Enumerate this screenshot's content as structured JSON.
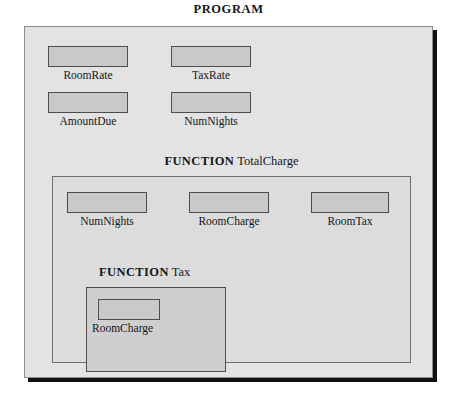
{
  "diagram": {
    "title": "PROGRAM",
    "program_scope": {
      "name": "PROGRAM",
      "variables": [
        {
          "label": "RoomRate"
        },
        {
          "label": "TaxRate"
        },
        {
          "label": "AmountDue"
        },
        {
          "label": "NumNights"
        }
      ]
    },
    "totalcharge_scope": {
      "keyword": "FUNCTION",
      "name": "TotalCharge",
      "variables": [
        {
          "label": "NumNights"
        },
        {
          "label": "RoomCharge"
        },
        {
          "label": "RoomTax"
        }
      ]
    },
    "tax_scope": {
      "keyword": "FUNCTION",
      "name": "Tax",
      "variables": [
        {
          "label": "RoomCharge"
        }
      ]
    }
  },
  "colors": {
    "program_fill": "#e3e3e3",
    "totalcharge_fill": "#dcdcdc",
    "tax_fill": "#cfcfcf",
    "variable_fill": "#c9c9c9",
    "border": "#4d4d4d",
    "text": "#16161a"
  }
}
